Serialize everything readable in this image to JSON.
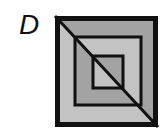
{
  "label": "D",
  "figure": {
    "colors": {
      "stroke": "#111111",
      "dark_grey": "#a3a3a3",
      "light_grey": "#c3c3c3",
      "background": "#ffffff"
    },
    "squares": [
      {
        "name": "outer",
        "x": 55,
        "y": 16,
        "width": 103,
        "height": 111,
        "upper_right_fill": "dark_grey",
        "lower_left_fill": "light_grey"
      },
      {
        "name": "middle",
        "x": 75,
        "y": 37,
        "width": 66,
        "height": 68,
        "upper_right_fill": "light_grey",
        "lower_left_fill": "dark_grey"
      },
      {
        "name": "inner",
        "x": 93,
        "y": 56,
        "width": 30,
        "height": 32,
        "upper_right_fill": "dark_grey",
        "lower_left_fill": "light_grey"
      }
    ],
    "diagonal": {
      "x1": 55,
      "y1": 16,
      "x2": 158,
      "y2": 127
    }
  }
}
